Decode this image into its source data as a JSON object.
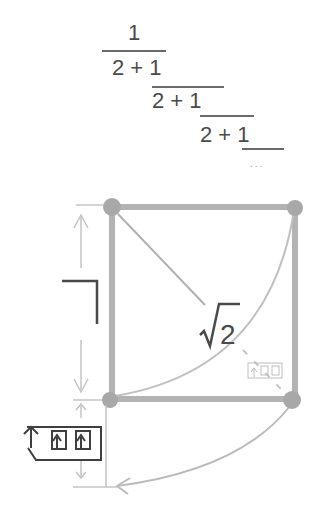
{
  "continued_fraction": {
    "numerator": "1",
    "rows": [
      "2 + 1",
      "2 + 1",
      "2 + 1"
    ],
    "ellipsis": "..."
  },
  "diagram": {
    "diagonal_label": "√2",
    "side_label_glyph": "1",
    "colors": {
      "square_stroke": "#b3b3b3",
      "vertex_fill": "#a6a6a6",
      "arrow_stroke": "#b8b8b8",
      "text": "#4a4a4a"
    }
  }
}
